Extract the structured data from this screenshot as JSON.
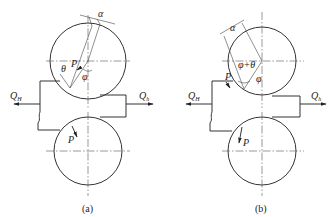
{
  "figure": {
    "panels": [
      {
        "id": "a",
        "caption": "(a)",
        "labels": {
          "alpha": "α",
          "theta": "θ",
          "phi": "φ",
          "force": "P",
          "force_lower": "P",
          "q_entry": "Q",
          "q_entry_sub": "H",
          "q_exit": "Q",
          "q_exit_sub": "h"
        }
      },
      {
        "id": "b",
        "caption": "(b)",
        "labels": {
          "alpha": "α",
          "phi_plus_theta": "φ+θ",
          "phi": "φ",
          "force": "P",
          "force_lower": "P",
          "q_entry": "Q",
          "q_entry_sub": "H",
          "q_exit": "Q",
          "q_exit_sub": "h"
        }
      }
    ]
  }
}
